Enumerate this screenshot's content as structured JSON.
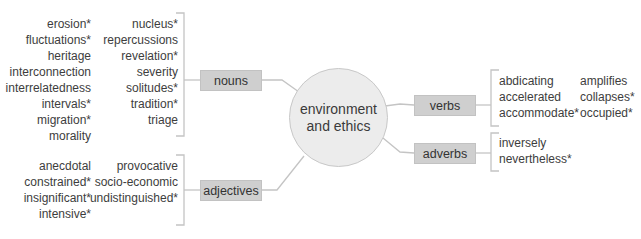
{
  "diagram": {
    "center": {
      "line1": "environment",
      "line2": "and ethics"
    },
    "branches": {
      "nouns": {
        "label": "nouns",
        "col1": [
          "erosion*",
          "fluctuations*",
          "heritage",
          "interconnection",
          "interrelatedness",
          "intervals*",
          "migration*",
          "morality"
        ],
        "col2": [
          "nucleus*",
          "repercussions",
          "revelation*",
          "severity",
          "solitudes*",
          "tradition*",
          "triage"
        ]
      },
      "adjectives": {
        "label": "adjectives",
        "col1": [
          "anecdotal",
          "constrained*",
          "insignificant*",
          "intensive*"
        ],
        "col2": [
          "provocative",
          "socio-economic",
          "undistinguished*"
        ]
      },
      "verbs": {
        "label": "verbs",
        "col1": [
          "abdicating",
          "accelerated",
          "accommodate*"
        ],
        "col2": [
          "amplifies",
          "collapses*",
          "occupied*"
        ]
      },
      "adverbs": {
        "label": "adverbs",
        "col1": [
          "inversely",
          "nevertheless*"
        ]
      }
    },
    "colors": {
      "box_fill": "#cfcfcf",
      "hub_fill": "#ececec",
      "line": "#c4c4c4",
      "text": "#3d3d3d"
    }
  }
}
